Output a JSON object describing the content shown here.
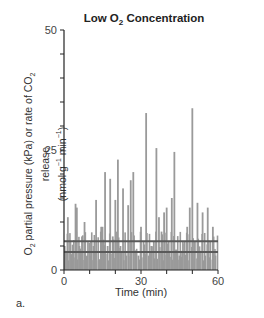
{
  "title_prefix": "Low O",
  "title_sub": "2",
  "title_suffix": " Concentration",
  "ylabel": {
    "line1_a": "O",
    "line1_sub1": "2",
    "line1_b": " partial pressure (kPa) or rate of CO",
    "line1_sub2": "2",
    "line1_c": " release",
    "line2_a": "(nmol g",
    "line2_sup1": "−1",
    "line2_b": " min",
    "line2_sup2": "−1",
    "line2_c": ")"
  },
  "xlabel": "Time (min)",
  "panel_label": "a.",
  "colors": {
    "bars": "#9a9a9a",
    "lines": "#5a5a5a",
    "axis": "#222222"
  },
  "chart_data": {
    "type": "bar",
    "title": "Low O2 Concentration",
    "xlabel": "Time (min)",
    "ylabel": "O2 partial pressure (kPa) or rate of CO2 release (nmol g−1 min−1)",
    "xlim": [
      0,
      60
    ],
    "ylim": [
      0,
      50
    ],
    "x_ticks": [
      0,
      30,
      60
    ],
    "y_ticks": [
      0,
      25,
      50
    ],
    "grid": false,
    "legend": null,
    "series": [
      {
        "name": "CO2 release rate (spikes)",
        "type": "bar",
        "x": [
          0.5,
          1.5,
          2.5,
          3.5,
          4.5,
          5.0,
          6.0,
          7.0,
          8.0,
          9.0,
          10.5,
          11.5,
          12.5,
          13.5,
          14.5,
          15.0,
          16.0,
          17.0,
          18.0,
          19.0,
          20.0,
          21.0,
          22.0,
          23.0,
          24.0,
          25.0,
          26.0,
          27.0,
          28.0,
          29.0,
          30.0,
          31.0,
          32.0,
          33.0,
          34.0,
          35.0,
          36.0,
          37.0,
          38.0,
          39.0,
          40.0,
          41.0,
          42.0,
          43.0,
          44.0,
          45.0,
          46.0,
          47.0,
          48.0,
          49.0,
          50.0,
          51.0,
          52.0,
          53.0,
          54.0,
          55.0,
          56.0,
          57.0,
          58.0,
          59.0
        ],
        "values": [
          4,
          11,
          6,
          2,
          13.8,
          13,
          5,
          7,
          10,
          3,
          6,
          5,
          14.6,
          2,
          9,
          9,
          20.4,
          5,
          19,
          7,
          14.6,
          23,
          5,
          17,
          4,
          13.5,
          18.7,
          20.4,
          4,
          3,
          9,
          6,
          32.7,
          3,
          5,
          6,
          25.4,
          11,
          8,
          12,
          13,
          4,
          15,
          24.6,
          3,
          3,
          4,
          6,
          9,
          13,
          33.7,
          6,
          14,
          4,
          12,
          3,
          13,
          6,
          9,
          3
        ]
      },
      {
        "name": "Reference level (upper)",
        "type": "hline",
        "y": 6.0
      },
      {
        "name": "Reference level (lower)",
        "type": "hline",
        "y": 3.75
      }
    ]
  }
}
